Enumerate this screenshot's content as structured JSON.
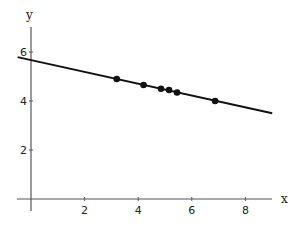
{
  "chart_data": {
    "type": "scatter",
    "title": "",
    "xlabel": "x",
    "ylabel": "y",
    "xlim": [
      -0.5,
      9.0
    ],
    "ylim": [
      0,
      7
    ],
    "x_ticks": [
      2,
      4,
      6,
      8
    ],
    "y_ticks": [
      2,
      4,
      6
    ],
    "grid": false,
    "legend": null,
    "series": [
      {
        "name": "data points",
        "type": "scatter",
        "x": [
          3.2,
          4.2,
          4.85,
          5.15,
          5.45,
          6.87
        ],
        "y": [
          4.9,
          4.65,
          4.5,
          4.45,
          4.35,
          4.0
        ]
      },
      {
        "name": "fitted line",
        "type": "line",
        "x": [
          -0.5,
          9.0
        ],
        "y": [
          5.79,
          3.5
        ],
        "intercept": 5.67,
        "slope": -0.24
      }
    ]
  },
  "colors": {
    "axis": "#555555",
    "line": "#111111",
    "point": "#111111",
    "background": "#ffffff"
  }
}
